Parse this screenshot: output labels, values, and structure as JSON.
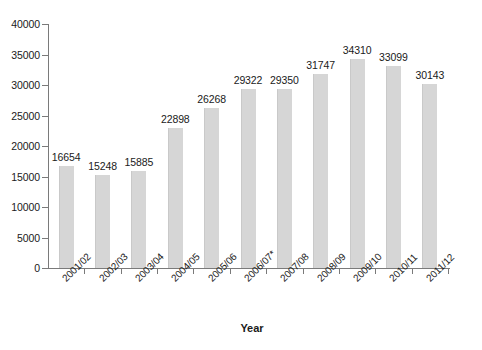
{
  "chart_data": {
    "type": "bar",
    "title": "",
    "subtitle": "",
    "xlabel": "Year",
    "ylabel": "",
    "ylim": [
      0,
      40000
    ],
    "ytick_values": [
      0,
      5000,
      10000,
      15000,
      20000,
      25000,
      30000,
      35000,
      40000
    ],
    "ytick_labels": [
      "0",
      "5000",
      "10000",
      "15000",
      "20000",
      "25000",
      "30000",
      "35000",
      "40000"
    ],
    "grid": false,
    "legend": false,
    "legend_position": "none",
    "bar_color": "#d6d6d6",
    "axis_color": "#7a7a7a",
    "text_color": "#1a1a1a",
    "data_labels_shown": true,
    "categories": [
      "2001/02",
      "2002/03",
      "2003/04",
      "2004/05",
      "2005/06",
      "2006/07*",
      "2007/08",
      "2008/09",
      "2009/10",
      "2010/11",
      "2011/12"
    ],
    "values": [
      16654,
      15248,
      15885,
      22898,
      26268,
      29322,
      29350,
      31747,
      34310,
      33099,
      30143
    ],
    "value_labels": [
      "16654",
      "15248",
      "15885",
      "22898",
      "26268",
      "29322",
      "29350",
      "31747",
      "34310",
      "33099",
      "30143"
    ]
  }
}
